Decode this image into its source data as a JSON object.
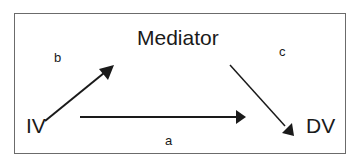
{
  "diagram": {
    "type": "mediation-model",
    "nodes": {
      "mediator": "Mediator",
      "iv": "IV",
      "dv": "DV"
    },
    "edges": {
      "b": "b",
      "c": "c",
      "a": "a"
    },
    "connections": [
      {
        "from": "IV",
        "to": "Mediator",
        "label": "b"
      },
      {
        "from": "Mediator",
        "to": "DV",
        "label": "c"
      },
      {
        "from": "IV",
        "to": "DV",
        "label": "a"
      }
    ],
    "colors": {
      "stroke": "#1a1a1a",
      "border": "#6b6b6b",
      "background": "#ffffff"
    }
  }
}
